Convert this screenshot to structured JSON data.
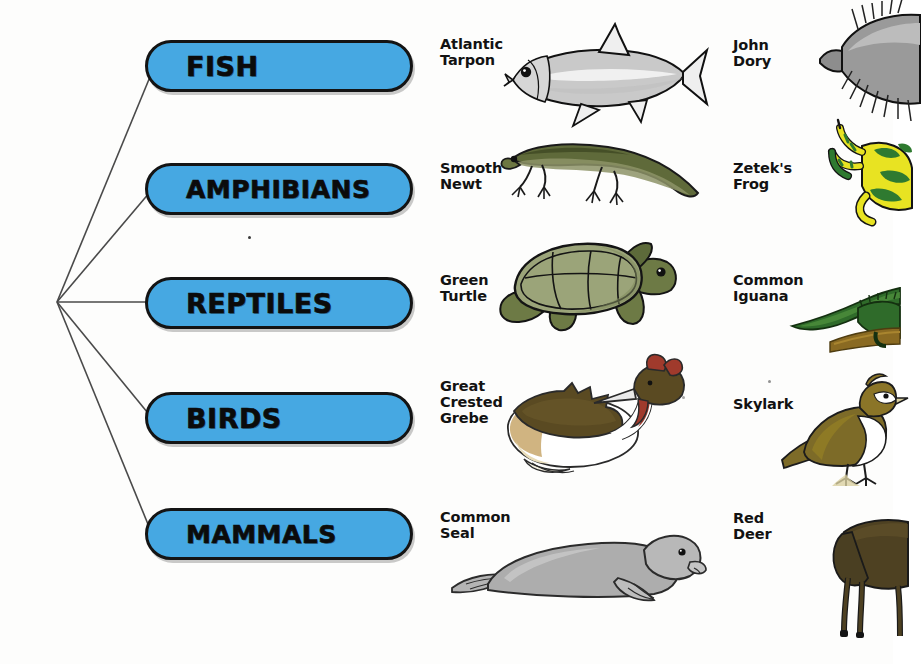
{
  "diagram": {
    "root_label": "",
    "accent_color": "#46a8e2",
    "outline_color": "#141414"
  },
  "categories": [
    {
      "id": "fish",
      "label": "FISH"
    },
    {
      "id": "amphibians",
      "label": "AMPHIBIANS"
    },
    {
      "id": "reptiles",
      "label": "REPTILES"
    },
    {
      "id": "birds",
      "label": "BIRDS"
    },
    {
      "id": "mammals",
      "label": "MAMMALS"
    }
  ],
  "examples": {
    "fish": {
      "middle": "Atlantic\nTarpon",
      "right": "John Dory"
    },
    "amphibians": {
      "middle": "Smooth\nNewt",
      "right": "Zetek's Frog"
    },
    "reptiles": {
      "middle": "Green\nTurtle",
      "right": "Common Iguana"
    },
    "birds": {
      "middle": "Great\nCrested\nGrebe",
      "right": "Skylark"
    },
    "mammals": {
      "middle": "Common Seal",
      "right": "Red Deer"
    }
  },
  "illustration_names": {
    "fish_middle": "atlantic-tarpon-illustration",
    "fish_right": "john-dory-illustration",
    "amphibians_middle": "smooth-newt-illustration",
    "amphibians_right": "zeteks-frog-illustration",
    "reptiles_middle": "green-turtle-illustration",
    "reptiles_right": "common-iguana-illustration",
    "birds_middle": "great-crested-grebe-illustration",
    "birds_right": "skylark-illustration",
    "mammals_middle": "common-seal-illustration",
    "mammals_right": "red-deer-illustration"
  }
}
